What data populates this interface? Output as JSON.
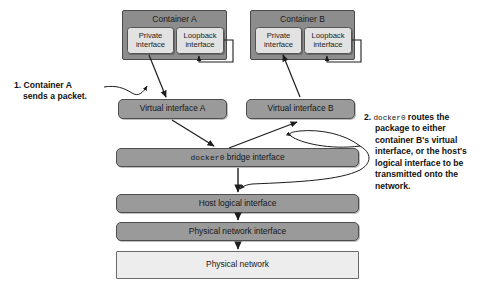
{
  "diagram": {
    "colors": {
      "container_fill": "#8d8d8d",
      "interface_fill": "#e2e2e2",
      "bar_fill": "#9a9a9a",
      "network_fill": "#ededed",
      "stroke": "#4a4a4a",
      "text": "#1b1b1b",
      "background": "#ffffff"
    },
    "containers": [
      {
        "id": "container-a",
        "title": "Container A",
        "interfaces": [
          {
            "id": "private-interface-a",
            "line1": "Private",
            "line2": "interface"
          },
          {
            "id": "loopback-interface-a",
            "line1": "Loopback",
            "line2": "interface"
          }
        ]
      },
      {
        "id": "container-b",
        "title": "Container B",
        "interfaces": [
          {
            "id": "private-interface-b",
            "line1": "Private",
            "line2": "interface"
          },
          {
            "id": "loopback-interface-b",
            "line1": "Loopback",
            "line2": "interface"
          }
        ]
      }
    ],
    "virtual_interfaces": [
      {
        "id": "virtual-interface-a",
        "label": "Virtual interface A"
      },
      {
        "id": "virtual-interface-b",
        "label": "Virtual interface B"
      }
    ],
    "bridge": {
      "id": "docker0-bridge-interface",
      "mono_prefix": "docker0",
      "label_suffix": " bridge interface"
    },
    "stack": [
      {
        "id": "host-logical-interface",
        "label": "Host logical interface",
        "style": "dark"
      },
      {
        "id": "physical-network-interface",
        "label": "Physical network interface",
        "style": "dark"
      },
      {
        "id": "physical-network",
        "label": "Physical network",
        "style": "light"
      }
    ],
    "callouts": [
      {
        "id": "callout-1",
        "number": "1.",
        "line1": "Container A",
        "line2": "sends a packet."
      },
      {
        "id": "callout-2",
        "number": "2.",
        "mono_term": "docker0",
        "text": " routes the package to either container B's virtual interface, or the host's logical interface to be transmitted onto the network."
      }
    ]
  }
}
